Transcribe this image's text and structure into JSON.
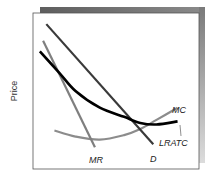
{
  "diagram": {
    "title": "",
    "y_axis_label": "Price",
    "x_axis_label": "",
    "curves": [
      {
        "id": "D",
        "label": "D",
        "kind": "demand",
        "shape": "straight-line, downward sloping",
        "color": "#3a3a3a"
      },
      {
        "id": "MR",
        "label": "MR",
        "kind": "marginal-revenue",
        "shape": "straight-line, steeper than demand",
        "color": "#7a7a7a"
      },
      {
        "id": "LRATC",
        "label": "LRATC",
        "kind": "long-run-average-total-cost",
        "shape": "U-shaped, tangent to demand",
        "color": "#000000"
      },
      {
        "id": "MC",
        "label": "MC",
        "kind": "marginal-cost",
        "shape": "U-shaped, rising",
        "color": "#8a8a8a"
      }
    ],
    "frame_shadow_color": "#6e6e6e"
  },
  "chart_data": {
    "type": "line",
    "title": "",
    "xlabel": "",
    "ylabel": "Price",
    "grid": false,
    "legend": "inline-labels",
    "xlim": [
      0,
      100
    ],
    "ylim": [
      0,
      100
    ],
    "series": [
      {
        "name": "D",
        "x": [
          7,
          73
        ],
        "y": [
          94,
          15
        ]
      },
      {
        "name": "MR",
        "x": [
          5,
          37
        ],
        "y": [
          83,
          13
        ]
      },
      {
        "name": "LRATC",
        "x": [
          3,
          15,
          25,
          40,
          55,
          65,
          75,
          88
        ],
        "y": [
          76,
          62,
          50,
          39,
          33,
          29,
          28,
          30
        ]
      },
      {
        "name": "MC",
        "x": [
          12,
          25,
          40,
          55,
          65,
          75,
          88
        ],
        "y": [
          24,
          20,
          18,
          21,
          25,
          31,
          39
        ]
      }
    ]
  }
}
